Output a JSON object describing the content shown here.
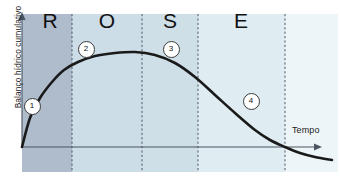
{
  "chart_data": {
    "type": "line",
    "title": "",
    "subtitle": "",
    "xlabel": "Tempo",
    "ylabel": "Balanço hídrico cumulativo",
    "xlim": [
      0,
      340
    ],
    "ylim": [
      -40,
      110
    ],
    "grid": false,
    "legend_position": "none",
    "axis_origin": {
      "x": 22,
      "y": 147
    },
    "x_axis_end": {
      "x": 320,
      "y": 147
    },
    "y_axis_top": {
      "x": 22,
      "y": 14
    },
    "series": [
      {
        "name": "Balanço hídrico cumulativo",
        "color": "#1a1a1a",
        "points": [
          {
            "x": 22,
            "y": 147
          },
          {
            "x": 30,
            "y": 118
          },
          {
            "x": 40,
            "y": 98
          },
          {
            "x": 52,
            "y": 82
          },
          {
            "x": 64,
            "y": 70
          },
          {
            "x": 78,
            "y": 62
          },
          {
            "x": 95,
            "y": 56
          },
          {
            "x": 115,
            "y": 53
          },
          {
            "x": 135,
            "y": 52
          },
          {
            "x": 155,
            "y": 55
          },
          {
            "x": 175,
            "y": 63
          },
          {
            "x": 195,
            "y": 77
          },
          {
            "x": 215,
            "y": 95
          },
          {
            "x": 235,
            "y": 113
          },
          {
            "x": 255,
            "y": 130
          },
          {
            "x": 270,
            "y": 140
          },
          {
            "x": 285,
            "y": 147
          },
          {
            "x": 300,
            "y": 153
          },
          {
            "x": 315,
            "y": 157
          },
          {
            "x": 332,
            "y": 160
          }
        ]
      }
    ],
    "phases": [
      {
        "letter": "R",
        "label_x": 50,
        "start_x": 22,
        "end_x": 72,
        "band_color": "#aebccb"
      },
      {
        "letter": "O",
        "label_x": 107,
        "start_x": 72,
        "end_x": 142,
        "band_color": "#ccdde7"
      },
      {
        "letter": "S",
        "label_x": 170,
        "start_x": 142,
        "end_x": 198,
        "band_color": "#cfdfe8"
      },
      {
        "letter": "E",
        "label_x": 241,
        "start_x": 198,
        "end_x": 285,
        "band_color": "#dfecf2"
      },
      {
        "letter": "",
        "label_x": 312,
        "start_x": 285,
        "end_x": 338,
        "band_color": "#eef5f8"
      }
    ],
    "dividers": [
      72,
      142,
      198,
      285
    ],
    "markers": [
      {
        "label": "1",
        "x": 31,
        "y": 105
      },
      {
        "label": "2",
        "x": 85,
        "y": 48
      },
      {
        "label": "3",
        "x": 170,
        "y": 48
      },
      {
        "label": "4",
        "x": 250,
        "y": 100
      }
    ],
    "colors": {
      "curve": "#1a1a1a",
      "axis": "#4a5560",
      "divider": "#3b4a58",
      "band_r": "#aebccb",
      "band_o": "#ccdde7",
      "band_s": "#cfdfe8",
      "band_e": "#dfecf2",
      "band_tail": "#eef5f8",
      "background": "#ffffff",
      "text": "#111111"
    }
  }
}
